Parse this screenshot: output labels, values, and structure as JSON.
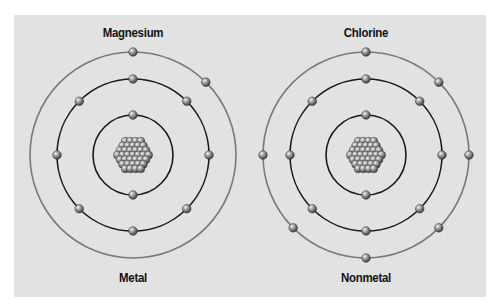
{
  "atoms": [
    {
      "name": "Magnesium",
      "category": "Metal",
      "center": [
        133,
        155
      ],
      "shells": [
        {
          "radius": 40,
          "electrons": 2,
          "angles": [
            -90,
            90
          ],
          "stroke": "#1a1a1a"
        },
        {
          "radius": 76,
          "electrons": 8,
          "angles": [
            -90,
            -45,
            0,
            45,
            90,
            135,
            180,
            225
          ],
          "stroke": "#1a1a1a"
        },
        {
          "radius": 103,
          "electrons": 2,
          "angles": [
            -90,
            -45
          ],
          "stroke": "#7a7a7a"
        }
      ]
    },
    {
      "name": "Chlorine",
      "category": "Nonmetal",
      "center": [
        366,
        155
      ],
      "shells": [
        {
          "radius": 40,
          "electrons": 2,
          "angles": [
            -90,
            90
          ],
          "stroke": "#1a1a1a"
        },
        {
          "radius": 76,
          "electrons": 8,
          "angles": [
            -90,
            -45,
            0,
            45,
            90,
            135,
            180,
            225
          ],
          "stroke": "#1a1a1a"
        },
        {
          "radius": 103,
          "electrons": 7,
          "angles": [
            -90,
            -45,
            0,
            45,
            90,
            135,
            180
          ],
          "stroke": "#7a7a7a"
        }
      ]
    }
  ],
  "colors": {
    "panel": "#e2e2e2",
    "electron_light": "#d8d8d8",
    "electron_dark": "#4a4a4a"
  }
}
